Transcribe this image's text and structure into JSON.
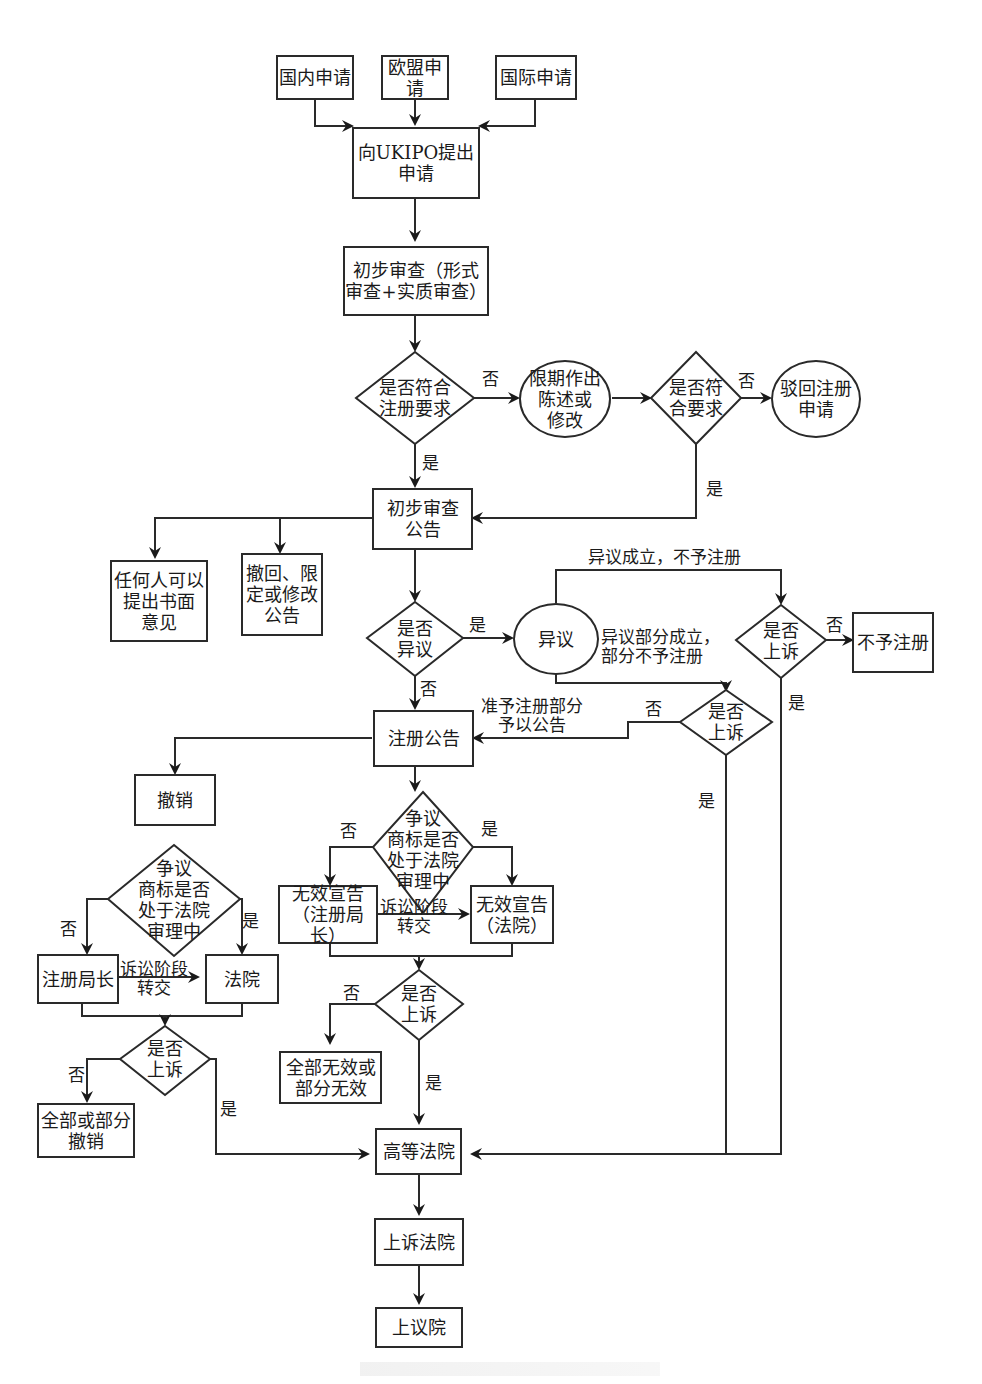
{
  "diagram": {
    "type": "flowchart",
    "topic": "UK trademark registration procedure",
    "nodes": {
      "domestic": "国内申请",
      "eu": "欧盟申请",
      "intl": "国际申请",
      "file_ukipo": "向UKIPO提出\n申请",
      "prelim_exam": "初步审查（形式\n审查+实质审查）",
      "meets_req": "是否符合\n注册要求",
      "deadline_reply": "限期作出\n陈述或\n修改",
      "meets_req2": "是否符\n合要求",
      "reject": "驳回注册\n申请",
      "prelim_notice": "初步审查\n公告",
      "anyone_opinion": "任何人可以\n提出书面\n意见",
      "withdraw_notice": "撤回、限\n定或修改\n公告",
      "opposed": "是否\n异议",
      "opposition": "异议",
      "appeal1": "是否\n上诉",
      "refuse_reg": "不予注册",
      "appeal2": "是否\n上诉",
      "reg_notice": "注册公告",
      "revoke": "撤销",
      "in_court_right": "争议\n商标是否\n处于法院\n审理中",
      "invalid_registrar": "无效宣告\n（注册局长）",
      "invalid_court": "无效宣告\n（法院）",
      "appeal3": "是否\n上诉",
      "all_part_invalid": "全部无效或\n部分无效",
      "in_court_left": "争议\n商标是否\n处于法院\n审理中",
      "registrar": "注册局长",
      "court": "法院",
      "appeal4": "是否\n上诉",
      "all_part_revoke": "全部或部分\n撤销",
      "high_court": "高等法院",
      "court_of_appeal": "上诉法院",
      "house_of_lords": "上议院"
    },
    "edge_labels": {
      "no_meets": "否",
      "yes_meets": "是",
      "no_meets2": "否",
      "yes_meets2": "是",
      "yes_opposed": "是",
      "no_opposed": "否",
      "opp_upheld": "异议成立，不予注册",
      "opp_partial": "异议部分成立，\n部分不予注册",
      "no_appeal1": "否",
      "yes_appeal1": "是",
      "no_appeal2": "否",
      "yes_appeal2": "是",
      "partial_notice": "准予注册部分\n予以公告",
      "no_court_right": "否",
      "yes_court_right": "是",
      "transfer_right": "诉讼阶段\n转交",
      "no_appeal3": "否",
      "yes_appeal3": "是",
      "no_court_left": "否",
      "yes_court_left": "是",
      "transfer_left": "诉讼阶段\n转交",
      "no_appeal4": "否",
      "yes_appeal4": "是"
    },
    "colors": {
      "stroke": "#2a2a2a",
      "text": "#1a1a1a",
      "background": "#ffffff"
    }
  }
}
